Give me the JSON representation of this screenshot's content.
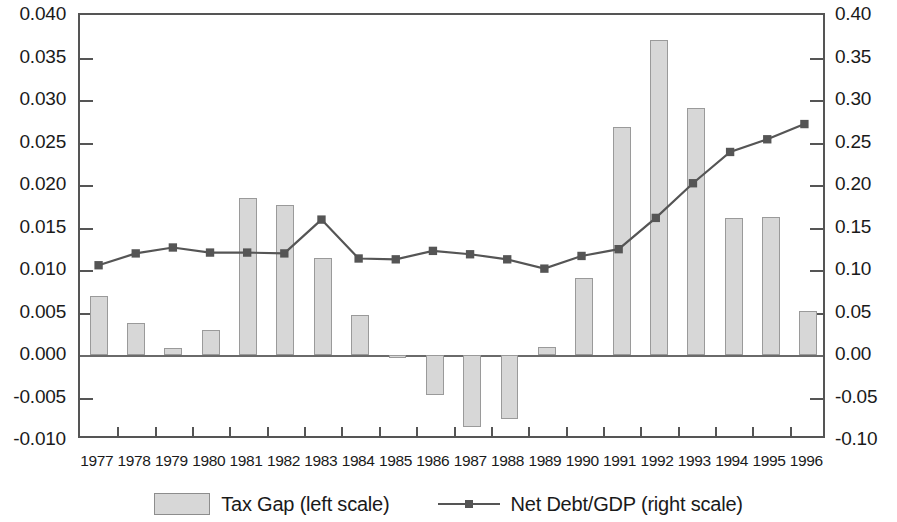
{
  "chart_data": {
    "type": "bar",
    "title": "",
    "subtitle": "",
    "xlabel": "",
    "ylabel": "",
    "grid": false,
    "legend_position": "bottom-center",
    "categories": [
      "1977",
      "1978",
      "1979",
      "1980",
      "1981",
      "1982",
      "1983",
      "1984",
      "1985",
      "1986",
      "1987",
      "1988",
      "1989",
      "1990",
      "1991",
      "1992",
      "1993",
      "1994",
      "1995",
      "1996"
    ],
    "axes": {
      "left": {
        "label": "",
        "ylim": [
          -0.01,
          0.04
        ],
        "ticks": [
          0.04,
          0.035,
          0.03,
          0.025,
          0.02,
          0.015,
          0.01,
          0.005,
          0.0,
          -0.005,
          -0.01
        ],
        "tick_labels": [
          "0.040",
          "0.035",
          "0.030",
          "0.025",
          "0.020",
          "0.015",
          "0.010",
          "0.005",
          "0.000",
          "-0.005",
          "-0.010"
        ]
      },
      "right": {
        "label": "",
        "ylim": [
          -0.1,
          0.4
        ],
        "ticks": [
          0.4,
          0.35,
          0.3,
          0.25,
          0.2,
          0.15,
          0.1,
          0.05,
          0.0,
          -0.05,
          -0.1
        ],
        "tick_labels": [
          "0.40",
          "0.35",
          "0.30",
          "0.25",
          "0.20",
          "0.15",
          "0.10",
          "0.05",
          "0.00",
          "-0.05",
          "-0.10"
        ]
      }
    },
    "series": [
      {
        "name": "Tax Gap (left scale)",
        "type": "bar",
        "axis": "left",
        "color": "#d7d7d7",
        "edge_color": "#9a9a9a",
        "values": [
          0.007,
          0.0038,
          0.0008,
          0.003,
          0.0185,
          0.0176,
          0.0114,
          0.0047,
          -0.0003,
          -0.0047,
          -0.0085,
          -0.0075,
          0.0009,
          0.0091,
          0.0268,
          0.0371,
          0.0291,
          0.0161,
          0.0162,
          0.0052
        ]
      },
      {
        "name": "Net Debt/GDP (right scale)",
        "type": "line",
        "axis": "right",
        "color": "#555555",
        "marker": "square",
        "values": [
          0.104,
          0.118,
          0.125,
          0.119,
          0.119,
          0.118,
          0.158,
          0.112,
          0.111,
          0.121,
          0.117,
          0.111,
          0.1,
          0.115,
          0.123,
          0.16,
          0.201,
          0.238,
          0.253,
          0.271
        ]
      }
    ]
  },
  "legend": {
    "entries": [
      {
        "label": "Tax Gap (left scale)",
        "swatch": "bar-swatch"
      },
      {
        "label": "Net Debt/GDP (right scale)",
        "swatch": "line-swatch"
      }
    ]
  }
}
